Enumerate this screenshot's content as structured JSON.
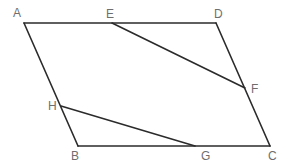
{
  "diagram": {
    "type": "geometry",
    "points": {
      "A": {
        "x": 24,
        "y": 23,
        "label": "A",
        "lx": 13,
        "ly": 17
      },
      "E": {
        "x": 112,
        "y": 23,
        "label": "E",
        "lx": 106,
        "ly": 18
      },
      "D": {
        "x": 216,
        "y": 23,
        "label": "D",
        "lx": 214,
        "ly": 18
      },
      "F": {
        "x": 245,
        "y": 88,
        "label": "F",
        "lx": 251,
        "ly": 93
      },
      "H": {
        "x": 61,
        "y": 106,
        "label": "H",
        "lx": 48,
        "ly": 110
      },
      "B": {
        "x": 78,
        "y": 146,
        "label": "B",
        "lx": 71,
        "ly": 160
      },
      "G": {
        "x": 195,
        "y": 146,
        "label": "G",
        "lx": 201,
        "ly": 160
      },
      "C": {
        "x": 270,
        "y": 146,
        "label": "C",
        "lx": 268,
        "ly": 160
      }
    },
    "edges": [
      {
        "from": "A",
        "to": "D"
      },
      {
        "from": "D",
        "to": "C"
      },
      {
        "from": "C",
        "to": "B"
      },
      {
        "from": "B",
        "to": "A"
      },
      {
        "from": "E",
        "to": "F"
      },
      {
        "from": "H",
        "to": "G"
      }
    ],
    "colors": {
      "line": "#2b2b2b",
      "label": "#6e6e6e",
      "background": "#ffffff"
    }
  }
}
